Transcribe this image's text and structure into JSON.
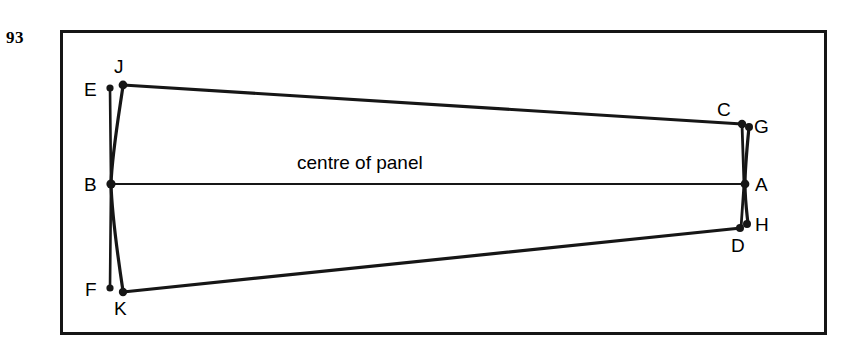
{
  "page": {
    "number": "93",
    "background_color": "#ffffff",
    "ink_color": "#161616"
  },
  "figure": {
    "frame": {
      "x": 60,
      "y": 30,
      "width": 767,
      "height": 305,
      "border_width": 3,
      "border_color": "#161616"
    },
    "caption": "centre of panel",
    "caption_position": {
      "x": 297,
      "y": 152
    },
    "centre_line": {
      "label": "centre of panel",
      "from": "B",
      "to": "A"
    },
    "vertices": [
      {
        "id": "E",
        "label": "E",
        "point_x": 111,
        "point_y": 88,
        "label_x": 84,
        "label_y": 80,
        "dot": true
      },
      {
        "id": "J",
        "label": "J",
        "point_x": 123,
        "point_y": 85,
        "label_x": 114,
        "label_y": 57,
        "dot": true
      },
      {
        "id": "B",
        "label": "B",
        "point_x": 111,
        "point_y": 184,
        "label_x": 84,
        "label_y": 175,
        "dot": true
      },
      {
        "id": "F",
        "label": "F",
        "point_x": 111,
        "point_y": 288,
        "label_x": 84,
        "label_y": 280,
        "dot": true
      },
      {
        "id": "K",
        "label": "K",
        "point_x": 123,
        "point_y": 292,
        "label_x": 114,
        "label_y": 299,
        "dot": true
      },
      {
        "id": "C",
        "label": "C",
        "point_x": 742,
        "point_y": 124,
        "label_x": 717,
        "label_y": 100,
        "dot": true
      },
      {
        "id": "G",
        "label": "G",
        "point_x": 749,
        "point_y": 127,
        "label_x": 754,
        "label_y": 117,
        "dot": true
      },
      {
        "id": "A",
        "label": "A",
        "point_x": 745,
        "point_y": 184,
        "label_x": 755,
        "label_y": 175,
        "dot": true
      },
      {
        "id": "H",
        "label": "H",
        "point_x": 747,
        "point_y": 224,
        "label_x": 755,
        "label_y": 215,
        "dot": true
      },
      {
        "id": "D",
        "label": "D",
        "point_x": 740,
        "point_y": 228,
        "label_x": 731,
        "label_y": 236,
        "dot": true
      }
    ],
    "edges": [
      {
        "name": "top-edge-J-C",
        "from": "J",
        "to": "C",
        "kind": "straight"
      },
      {
        "name": "centre-line-B-A",
        "from": "B",
        "to": "A",
        "kind": "straight"
      },
      {
        "name": "bottom-edge-K-D",
        "from": "K",
        "to": "D",
        "kind": "straight"
      },
      {
        "name": "left-edge-E-F",
        "from": "E",
        "to": "F",
        "kind": "straight-through-B"
      },
      {
        "name": "left-curve-J-K",
        "from": "J",
        "to": "K",
        "kind": "bowed-through-B"
      },
      {
        "name": "right-edge-C-D",
        "from": "C",
        "to": "D",
        "kind": "straight-through-A"
      },
      {
        "name": "right-curve-G-H",
        "from": "G",
        "to": "H",
        "kind": "bowed-through-A"
      }
    ]
  }
}
